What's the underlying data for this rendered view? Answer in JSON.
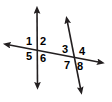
{
  "diagram": {
    "background_color": "#ffffff",
    "line_color": "#231f20",
    "label_color": "#000000",
    "stroke_width": 1.6,
    "lines": [
      {
        "name": "vertical-line",
        "x1": 37,
        "y1": 10,
        "x2": 37.5,
        "y2": 86,
        "arrow_start": true,
        "arrow_end": true
      },
      {
        "name": "horizontal-transversal",
        "x1": 7,
        "y1": 44.5,
        "x2": 101,
        "y2": 62.5,
        "arrow_start": true,
        "arrow_end": true
      },
      {
        "name": "slanted-transversal",
        "x1": 67,
        "y1": 20,
        "x2": 81,
        "y2": 91,
        "arrow_start": true,
        "arrow_end": true
      }
    ],
    "intersections": [
      {
        "name": "left-intersection",
        "x": 37,
        "y": 49.5
      },
      {
        "name": "right-intersection",
        "x": 74,
        "y": 57.5
      }
    ],
    "angle_labels": [
      {
        "id": "1",
        "text": "1",
        "x": 26,
        "y": 36,
        "position": "upper-left-of-left-intersection"
      },
      {
        "id": "2",
        "text": "2",
        "x": 40,
        "y": 36,
        "position": "upper-right-of-left-intersection"
      },
      {
        "id": "5",
        "text": "5",
        "x": 26,
        "y": 51,
        "position": "lower-left-of-left-intersection"
      },
      {
        "id": "6",
        "text": "6",
        "x": 40,
        "y": 53,
        "position": "lower-right-of-left-intersection"
      },
      {
        "id": "3",
        "text": "3",
        "x": 62,
        "y": 44,
        "position": "upper-left-of-right-intersection"
      },
      {
        "id": "4",
        "text": "4",
        "x": 79,
        "y": 46,
        "position": "upper-right-of-right-intersection"
      },
      {
        "id": "7",
        "text": "7",
        "x": 64,
        "y": 60,
        "position": "lower-left-of-right-intersection"
      },
      {
        "id": "8",
        "text": "8",
        "x": 77,
        "y": 61,
        "position": "lower-right-of-right-intersection"
      }
    ]
  }
}
